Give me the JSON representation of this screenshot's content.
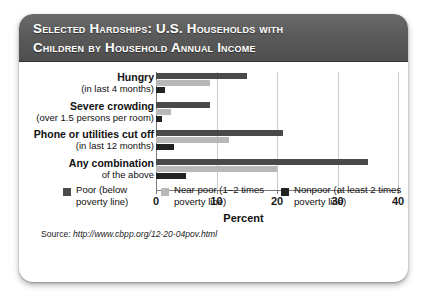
{
  "card": {
    "title_line1": "Selected Hardships: U.S. Households with",
    "title_line2": "Children by Household Annual Income"
  },
  "source": {
    "label": "Source: ",
    "url": "http://www.cbpp.org/12-20-04pov.html"
  },
  "colors": {
    "header_bg": "#585858",
    "poor": "#4a4a4a",
    "near_poor": "#b8b8b8",
    "nonpoor": "#222222",
    "grid": "#c9c9c9",
    "axis": "#7a7a7a",
    "card_bg": "#ffffff",
    "title_text": "#ffffff"
  },
  "chart_data": {
    "type": "bar",
    "orientation": "horizontal",
    "title": "Selected Hardships: U.S. Households with Children by Household Annual Income",
    "xlabel": "Percent",
    "ylabel": "",
    "xlim": [
      0,
      40
    ],
    "xticks": [
      0,
      10,
      20,
      30,
      40
    ],
    "grid": true,
    "legend_position": "bottom",
    "categories": [
      "Hungry (in last 4 months)",
      "Severe crowding (over 1.5 persons per room)",
      "Phone or utilities cut off (in last 12 months)",
      "Any combination of the above"
    ],
    "category_lines": [
      {
        "line1": "Hungry",
        "line2": "(in last 4 months)"
      },
      {
        "line1": "Severe crowding",
        "line2": "(over 1.5 persons per room)"
      },
      {
        "line1": "Phone or utilities cut off",
        "line2": "(in last 12 months)"
      },
      {
        "line1": "Any combination",
        "line2": "of the above"
      }
    ],
    "series": [
      {
        "name": "Poor (below poverty line)",
        "color": "#4a4a4a",
        "values": [
          15,
          9,
          21,
          35
        ]
      },
      {
        "name": "Near poor (1–2 times poverty line)",
        "color": "#b8b8b8",
        "values": [
          9,
          2.5,
          12,
          20
        ]
      },
      {
        "name": "Nonpoor (at least 2 times poverty line)",
        "color": "#222222",
        "values": [
          1.5,
          1,
          3,
          5
        ]
      }
    ]
  },
  "legend": [
    {
      "line1": "Poor (below",
      "line2": "poverty line)",
      "color": "#4a4a4a"
    },
    {
      "line1": "Near poor (1–2 times",
      "line2": "poverty line)",
      "color": "#b8b8b8"
    },
    {
      "line1": "Nonpoor (at least 2 times",
      "line2": "poverty line)",
      "color": "#222222"
    }
  ]
}
